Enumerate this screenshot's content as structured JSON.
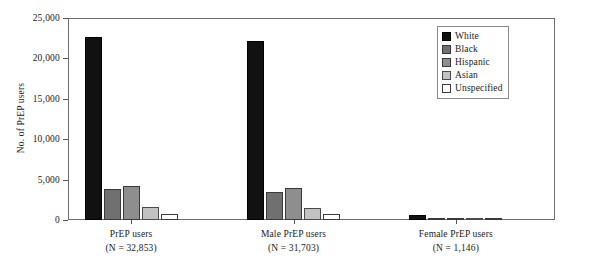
{
  "chart_data": {
    "type": "bar",
    "title": "",
    "xlabel": "",
    "ylabel": "No. of PrEP users",
    "ylim": [
      0,
      25000
    ],
    "ytick_labels": [
      "0",
      "5,000",
      "10,000",
      "15,000",
      "20,000",
      "25,000"
    ],
    "ytick_values": [
      0,
      5000,
      10000,
      15000,
      20000,
      25000
    ],
    "grid": false,
    "legend_position": "top-right",
    "categories": [
      "PrEP users\n(N = 32,853)",
      "Male PrEP users\n(N = 31,703)",
      "Female PrEP users\n(N = 1,146)"
    ],
    "category_lines": [
      {
        "line1": "PrEP users",
        "line2": "(N = 32,853)"
      },
      {
        "line1": "Male PrEP users",
        "line2": "(N = 31,703)"
      },
      {
        "line1": "Female PrEP users",
        "line2": "(N = 1,146)"
      }
    ],
    "series": [
      {
        "name": "White",
        "color": "#111111",
        "values": [
          22600,
          22100,
          570
        ]
      },
      {
        "name": "Black",
        "color": "#707070",
        "values": [
          3800,
          3450,
          300
        ]
      },
      {
        "name": "Hispanic",
        "color": "#8e8e8e",
        "values": [
          4200,
          4000,
          200
        ]
      },
      {
        "name": "Asian",
        "color": "#c2c2c2",
        "values": [
          1550,
          1450,
          100
        ]
      },
      {
        "name": "Unspecified",
        "color": "#ffffff",
        "values": [
          800,
          700,
          80
        ]
      }
    ]
  },
  "legend": {
    "items": [
      {
        "label": "White"
      },
      {
        "label": "Black"
      },
      {
        "label": "Hispanic"
      },
      {
        "label": "Asian"
      },
      {
        "label": "Unspecified"
      }
    ]
  },
  "axes": {
    "y_title": "No. of PrEP users"
  }
}
